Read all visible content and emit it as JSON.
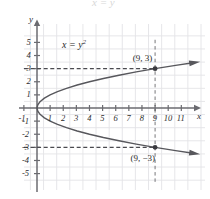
{
  "figure": {
    "equation_label": "x = y",
    "equation_exponent": "2",
    "x_axis_name": "x",
    "y_axis_name": "y",
    "ghost_artifact": "x = y"
  },
  "chart_data": {
    "type": "line",
    "title": "",
    "subtitle": "",
    "xlabel": "x",
    "ylabel": "y",
    "xlim": [
      -1.5,
      12.2
    ],
    "ylim": [
      -5.8,
      5.8
    ],
    "grid": true,
    "legend": "none",
    "annotations": [
      {
        "text": "x = y^2",
        "x": 2.6,
        "y": 4.1
      },
      {
        "text": "(9, 3)",
        "x": 8.1,
        "y": 3.75
      },
      {
        "text": "(9, -3)",
        "x": 8.1,
        "y": -3.85
      }
    ],
    "points": [
      {
        "label": "(9, 3)",
        "x": 9,
        "y": 3
      },
      {
        "label": "(9, -3)",
        "x": 9,
        "y": -3
      }
    ],
    "guides": [
      {
        "type": "horizontal-dashed",
        "y": 3,
        "from_x": -1.0,
        "to_x": 9
      },
      {
        "type": "horizontal-dashed",
        "y": -3,
        "from_x": -1.0,
        "to_x": 9
      },
      {
        "type": "vertical-dashed",
        "x": 9,
        "from_y": -5.8,
        "to_y": 5.2
      }
    ],
    "series": [
      {
        "name": "x = y^2 (upper branch)",
        "x": [
          0,
          0.0625,
          0.25,
          0.5625,
          1,
          1.5625,
          2.25,
          3.0625,
          4,
          5.0625,
          6.25,
          7.5625,
          9,
          10.5625,
          11.9
        ],
        "y": [
          0,
          0.25,
          0.5,
          0.75,
          1,
          1.25,
          1.5,
          1.75,
          2,
          2.25,
          2.5,
          2.75,
          3,
          3.25,
          3.45
        ]
      },
      {
        "name": "x = y^2 (lower branch)",
        "x": [
          0,
          0.0625,
          0.25,
          0.5625,
          1,
          1.5625,
          2.25,
          3.0625,
          4,
          5.0625,
          6.25,
          7.5625,
          9,
          10.5625,
          11.9
        ],
        "y": [
          0,
          -0.25,
          -0.5,
          -0.75,
          -1,
          -1.25,
          -1.5,
          -1.75,
          -2,
          -2.25,
          -2.5,
          -2.75,
          -3,
          -3.25,
          -3.45
        ]
      }
    ],
    "x_ticks": [
      {
        "value": -1,
        "label": "-1"
      },
      {
        "value": 1,
        "label": "1"
      },
      {
        "value": 2,
        "label": "2"
      },
      {
        "value": 3,
        "label": "3"
      },
      {
        "value": 4,
        "label": "4"
      },
      {
        "value": 5,
        "label": "5"
      },
      {
        "value": 6,
        "label": "6"
      },
      {
        "value": 7,
        "label": "7"
      },
      {
        "value": 8,
        "label": "8"
      },
      {
        "value": 9,
        "label": "9"
      },
      {
        "value": 10,
        "label": "10"
      },
      {
        "value": 11,
        "label": "11"
      }
    ],
    "y_ticks": [
      {
        "value": 5,
        "label": "5"
      },
      {
        "value": 4,
        "label": "4"
      },
      {
        "value": 3,
        "label": "3"
      },
      {
        "value": 2,
        "label": "2"
      },
      {
        "value": 1,
        "label": "1"
      },
      {
        "value": -1,
        "label": "-1"
      },
      {
        "value": -2,
        "label": "-2"
      },
      {
        "value": -3,
        "label": "-3"
      },
      {
        "value": -4,
        "label": "-4"
      },
      {
        "value": -5,
        "label": "-5"
      }
    ],
    "colors": {
      "grid": "#e3e3e6",
      "axis": "#6b6b70",
      "curve": "#57575c",
      "dashed_guide": "#4a4a4f",
      "point": "#3a3a3f",
      "text": "#2b2b2b"
    }
  }
}
